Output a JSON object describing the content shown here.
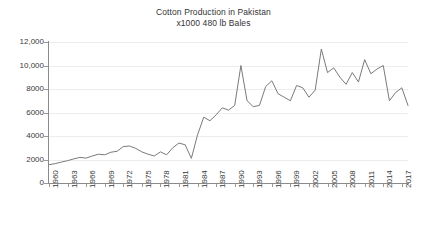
{
  "chart_data": {
    "type": "line",
    "title": "Cotton Production in Pakistan",
    "subtitle": "x1000 480 lb Bales",
    "xlabel": "",
    "ylabel": "",
    "grid": true,
    "legend": "none",
    "line_color": "#7a7a7a",
    "axis_color": "#8a8a8a",
    "grid_color": "#ededed",
    "xlim": [
      1960,
      2018
    ],
    "ylim": [
      0,
      12000
    ],
    "y_ticks": [
      0,
      2000,
      4000,
      6000,
      8000,
      10000,
      12000
    ],
    "y_tick_labels": [
      "0",
      "2000",
      "4000",
      "6000",
      "8000",
      "10,000",
      "12,000"
    ],
    "x_tick_years": [
      1960,
      1963,
      1966,
      1969,
      1972,
      1975,
      1978,
      1981,
      1984,
      1987,
      1990,
      1993,
      1996,
      1999,
      2002,
      2005,
      2008,
      2011,
      2014,
      2017
    ],
    "x_tick_labels": [
      "1960",
      "1963",
      "1966",
      "1969",
      "1972",
      "1975",
      "1978",
      "1981",
      "1984",
      "1987",
      "1990",
      "1993",
      "1996",
      "1999",
      "2002",
      "2005",
      "2008",
      "2011",
      "2014",
      "2017"
    ],
    "x": [
      1960,
      1961,
      1962,
      1963,
      1964,
      1965,
      1966,
      1967,
      1968,
      1969,
      1970,
      1971,
      1972,
      1973,
      1974,
      1975,
      1976,
      1977,
      1978,
      1979,
      1980,
      1981,
      1982,
      1983,
      1984,
      1985,
      1986,
      1987,
      1988,
      1989,
      1990,
      1991,
      1992,
      1993,
      1994,
      1995,
      1996,
      1997,
      1998,
      1999,
      2000,
      2001,
      2002,
      2003,
      2004,
      2005,
      2006,
      2007,
      2008,
      2009,
      2010,
      2011,
      2012,
      2013,
      2014,
      2015,
      2016,
      2017,
      2018
    ],
    "values": [
      1560,
      1650,
      1780,
      1900,
      2050,
      2180,
      2120,
      2300,
      2450,
      2400,
      2620,
      2700,
      3100,
      3150,
      2950,
      2650,
      2450,
      2300,
      2650,
      2400,
      3000,
      3400,
      3250,
      2100,
      4100,
      5600,
      5300,
      5800,
      6400,
      6200,
      6600,
      10000,
      7000,
      6500,
      6600,
      8200,
      8700,
      7600,
      7300,
      7000,
      8300,
      8100,
      7300,
      7900,
      11400,
      9400,
      9800,
      9000,
      8400,
      9400,
      8600,
      10500,
      9300,
      9700,
      10000,
      7000,
      7700,
      8100,
      6600
    ]
  },
  "axes": {
    "y_axis_name": "y-axis",
    "x_axis_name": "x-axis"
  }
}
